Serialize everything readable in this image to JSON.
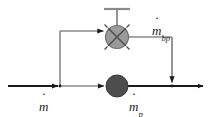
{
  "diagram": {
    "background_color": "#ffffff",
    "line_color": "#7f7f7f",
    "arrow_color": "#1a1a1a",
    "valve_fill": "#8c8c8c",
    "pump_fill": "#4d4d4d",
    "labels": {
      "inlet": {
        "symbol": "m",
        "dot": true,
        "subscript": ""
      },
      "bypass": {
        "symbol": "m",
        "dot": true,
        "subscript": "bp"
      },
      "pump": {
        "symbol": "m",
        "dot": true,
        "subscript": "p"
      }
    },
    "components": {
      "valve": {
        "name": "bypass-control-valve",
        "shape": "circle-with-x",
        "cx": 117,
        "cy": 37,
        "r": 12
      },
      "valve_handle": {
        "name": "valve-handle",
        "stem_top_y": 8,
        "bar_half_width": 13
      },
      "pump": {
        "name": "pump",
        "shape": "filled-circle",
        "cx": 117,
        "cy": 86,
        "r": 11
      }
    },
    "lines": {
      "inlet_main": {
        "y": 86,
        "x_start": 8,
        "x_end": 60
      },
      "bypass_riser": {
        "x": 60,
        "y_top": 31,
        "y_bottom": 86
      },
      "bypass_to_valve": {
        "y": 31,
        "x_start": 60,
        "x_end": 105
      },
      "valve_to_drop": {
        "y": 37,
        "x_start": 129,
        "x_end": 172
      },
      "bypass_drop": {
        "x": 172,
        "y_top": 37,
        "y_bottom": 86
      },
      "junction_to_pump": {
        "y": 86,
        "x_start": 60,
        "x_end": 106
      },
      "pump_outlet": {
        "y": 86,
        "x_start": 128,
        "x_end": 205
      }
    }
  }
}
